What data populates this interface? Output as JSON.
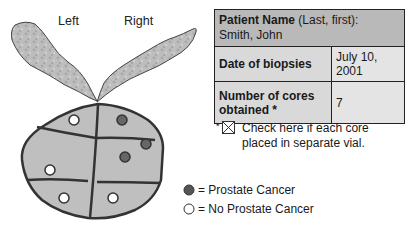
{
  "diagram": {
    "labels": {
      "left": "Left",
      "right": "Right"
    },
    "colors": {
      "vesicle": "#bdbdbd",
      "prostate": "#bfbfbf",
      "outline": "#333333",
      "cancer": "#666666",
      "no_cancer": "#ffffff"
    },
    "cores": [
      {
        "region": "left-top",
        "result": "no_cancer"
      },
      {
        "region": "right-top",
        "result": "cancer"
      },
      {
        "region": "right-mid-edge",
        "result": "cancer"
      },
      {
        "region": "right-mid",
        "result": "cancer"
      },
      {
        "region": "left-mid",
        "result": "no_cancer"
      },
      {
        "region": "left-bottom",
        "result": "no_cancer"
      },
      {
        "region": "right-bottom",
        "result": "no_cancer"
      }
    ]
  },
  "table": {
    "patient_name_label": "Patient Name",
    "patient_name_hint": " (Last, first):",
    "patient_name_value": "Smith, John",
    "date_label": "Date of biopsies",
    "date_value": "July 10, 2001",
    "cores_label": "Number of cores obtained *",
    "cores_value": "7"
  },
  "note": {
    "asterisk": "*",
    "checked": true,
    "text": "Check here if each core placed in separate vial."
  },
  "legend": {
    "cancer": "= Prostate Cancer",
    "no_cancer": "= No Prostate Cancer"
  }
}
